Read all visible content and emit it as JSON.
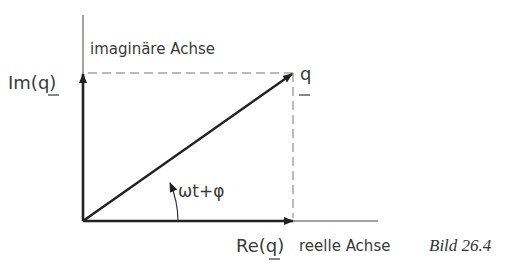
{
  "diagram": {
    "labels": {
      "imag_axis": "imaginäre Achse",
      "real_axis": "reelle Achse",
      "im_q_prefix": "Im(",
      "im_q_var": "q",
      "im_q_suffix": ")",
      "re_q_prefix": "Re(",
      "re_q_var": "q",
      "re_q_suffix": ")",
      "phasor": "q",
      "angle": "ωt+φ",
      "caption": "Bild 26.4"
    },
    "colors": {
      "stroke": "#222222",
      "dashed": "#777777",
      "text": "#3a3a3a"
    }
  }
}
